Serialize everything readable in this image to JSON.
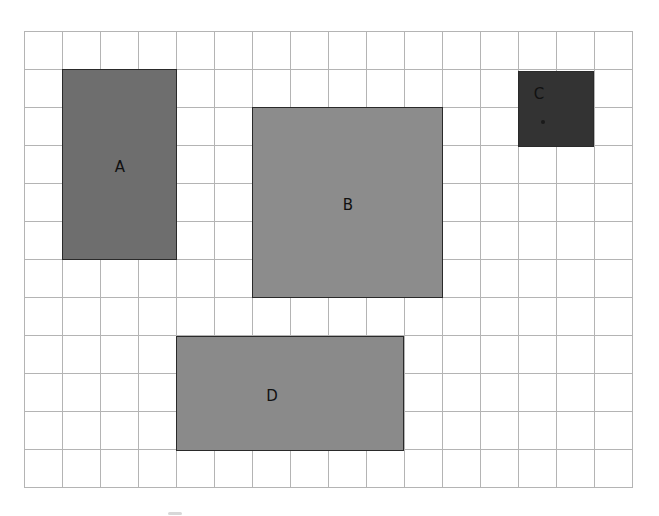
{
  "diagram": {
    "type": "grid-regions",
    "grid": {
      "columns": 16,
      "rows": 12,
      "cell_size_px": 38,
      "line_color": "#b4b4b4"
    },
    "regions": [
      {
        "label": "A",
        "col": 1,
        "row": 1,
        "width_cells": 3,
        "height_cells": 5,
        "color": "#6e6e6e",
        "label_pos": "center"
      },
      {
        "label": "B",
        "col": 6,
        "row": 2,
        "width_cells": 5,
        "height_cells": 5,
        "color": "#8c8c8c",
        "label_pos": "center"
      },
      {
        "label": "C",
        "col": 13,
        "row": 1,
        "width_cells": 2,
        "height_cells": 2,
        "color": "#333333",
        "label_pos": "top-left"
      },
      {
        "label": "D",
        "col": 4,
        "row": 8,
        "width_cells": 6,
        "height_cells": 3,
        "color": "#8a8a8a",
        "label_pos": "center"
      }
    ]
  }
}
